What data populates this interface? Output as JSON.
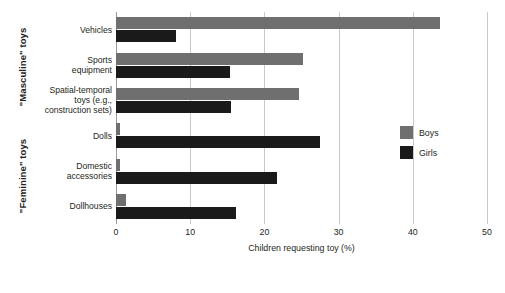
{
  "chart_data": {
    "type": "bar",
    "orientation": "horizontal",
    "title": "",
    "xlabel": "Children requesting toy (%)",
    "ylabel": "",
    "xlim": [
      0,
      50
    ],
    "xticks": [
      0,
      10,
      20,
      30,
      40,
      50
    ],
    "grid": true,
    "legend_position": "right-middle",
    "categories": [
      "Vehicles",
      "Sports equipment",
      "Spatial-temporal toys (e.g., construction sets)",
      "Dolls",
      "Domestic accessories",
      "Dollhouses"
    ],
    "category_lines": [
      [
        "Vehicles"
      ],
      [
        "Sports",
        "equipment"
      ],
      [
        "Spatial-temporal",
        "toys (e.g.,",
        "construction sets)"
      ],
      [
        "Dolls"
      ],
      [
        "Domestic",
        "accessories"
      ],
      [
        "Dollhouses"
      ]
    ],
    "group_labels": [
      "\"Masculine\" toys",
      "\"Feminine\" toys"
    ],
    "group_spans": [
      {
        "label": "\"Masculine\" toys",
        "categories": [
          "Vehicles",
          "Sports equipment",
          "Spatial-temporal toys (e.g., construction sets)"
        ]
      },
      {
        "label": "\"Feminine\" toys",
        "categories": [
          "Dolls",
          "Domestic accessories",
          "Dollhouses"
        ]
      }
    ],
    "series": [
      {
        "name": "Boys",
        "color": "#6f6f6f",
        "values": [
          43.7,
          25.2,
          24.7,
          0.5,
          0.5,
          1.4
        ]
      },
      {
        "name": "Girls",
        "color": "#1a1a1a",
        "values": [
          8.1,
          15.4,
          15.5,
          27.5,
          21.7,
          16.2
        ]
      }
    ]
  },
  "legend": {
    "items": [
      {
        "label": "Boys"
      },
      {
        "label": "Girls"
      }
    ]
  }
}
